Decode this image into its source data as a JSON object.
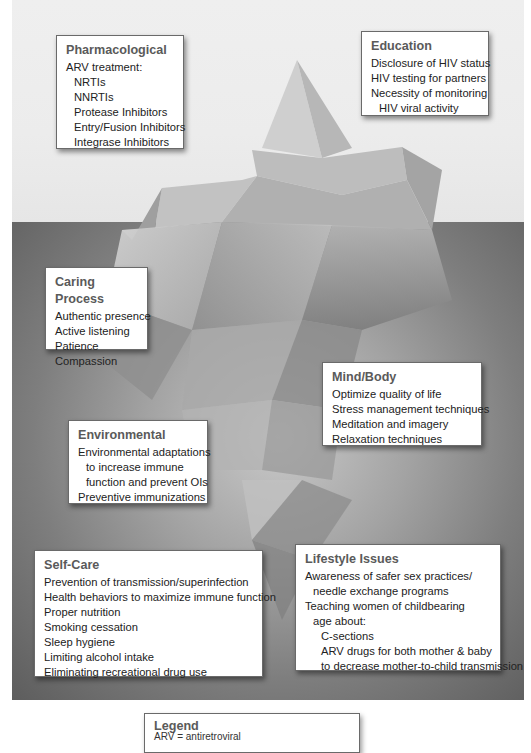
{
  "diagram": {
    "type": "iceberg-model",
    "waterline_y": 222
  },
  "boxes": [
    {
      "id": "pharmacological",
      "region": "above-water",
      "title": "Pharmacological",
      "lines": [
        {
          "text": "ARV treatment:",
          "indent": 0
        },
        {
          "text": "NRTIs",
          "indent": 1
        },
        {
          "text": "NNRTIs",
          "indent": 1
        },
        {
          "text": "Protease Inhibitors",
          "indent": 1
        },
        {
          "text": "Entry/Fusion Inhibitors",
          "indent": 1
        },
        {
          "text": "Integrase Inhibitors",
          "indent": 1
        }
      ]
    },
    {
      "id": "education",
      "region": "above-water",
      "title": "Education",
      "lines": [
        {
          "text": "Disclosure of HIV status",
          "indent": 0
        },
        {
          "text": "HIV testing for partners",
          "indent": 0
        },
        {
          "text": "Necessity of monitoring",
          "indent": 0
        },
        {
          "text": "HIV viral activity",
          "indent": 1
        }
      ]
    },
    {
      "id": "caring-process",
      "region": "below-water",
      "title": "Caring Process",
      "lines": [
        {
          "text": "Authentic presence",
          "indent": 0
        },
        {
          "text": "Active listening",
          "indent": 0
        },
        {
          "text": "Patience",
          "indent": 0
        },
        {
          "text": "Compassion",
          "indent": 0
        }
      ]
    },
    {
      "id": "mind-body",
      "region": "below-water",
      "title": "Mind/Body",
      "lines": [
        {
          "text": "Optimize quality of life",
          "indent": 0
        },
        {
          "text": "Stress management techniques",
          "indent": 0
        },
        {
          "text": "Meditation and imagery",
          "indent": 0
        },
        {
          "text": "Relaxation techniques",
          "indent": 0
        }
      ]
    },
    {
      "id": "environmental",
      "region": "below-water",
      "title": "Environmental",
      "lines": [
        {
          "text": "Environmental adaptations",
          "indent": 0
        },
        {
          "text": "to increase immune",
          "indent": 1
        },
        {
          "text": "function and prevent OIs",
          "indent": 1
        },
        {
          "text": "Preventive immunizations",
          "indent": 0
        }
      ]
    },
    {
      "id": "self-care",
      "region": "below-water",
      "title": "Self-Care",
      "lines": [
        {
          "text": "Prevention of transmission/superinfection",
          "indent": 0
        },
        {
          "text": "Health behaviors to maximize immune function",
          "indent": 0
        },
        {
          "text": "Proper nutrition",
          "indent": 0
        },
        {
          "text": "Smoking cessation",
          "indent": 0
        },
        {
          "text": "Sleep hygiene",
          "indent": 0
        },
        {
          "text": "Limiting alcohol intake",
          "indent": 0
        },
        {
          "text": "Eliminating recreational drug use",
          "indent": 0
        }
      ]
    },
    {
      "id": "lifestyle-issues",
      "region": "below-water",
      "title": "Lifestyle Issues",
      "lines": [
        {
          "text": "Awareness of safer sex practices/",
          "indent": 0
        },
        {
          "text": "needle exchange programs",
          "indent": 1
        },
        {
          "text": "Teaching women of childbearing",
          "indent": 0
        },
        {
          "text": "age about:",
          "indent": 1
        },
        {
          "text": "C-sections",
          "indent": 2
        },
        {
          "text": "ARV drugs for both mother & baby",
          "indent": 2
        },
        {
          "text": "to decrease mother-to-child transmission",
          "indent": 2
        }
      ]
    }
  ],
  "legend": {
    "title": "Legend",
    "partial_text": "ARV = antiretroviral"
  },
  "colors": {
    "sky": "#ececec",
    "water_light": "#c9c9c9",
    "water_dark": "#5d5d5d",
    "box_border": "#6a6a6a",
    "title_text": "#5a5a5a",
    "body_text": "#222222"
  }
}
